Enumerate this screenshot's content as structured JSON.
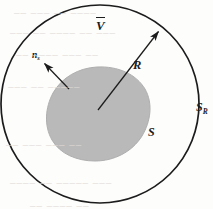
{
  "figure": {
    "caption_labels": {
      "outer_volume": "V",
      "outer_volume_has_overbar": true,
      "normal_vector": "n",
      "normal_vector_subscript": "s",
      "radius": "R",
      "inner_surface": "S",
      "outer_surface": "S",
      "outer_surface_subscript": "R"
    },
    "colors": {
      "stroke": "#1c1c1c",
      "blob_fill": "#b9b9b9",
      "blob_stroke": "#a8a8a8",
      "background": "#fdfdfc",
      "bleed_text": "#ded9d6"
    },
    "geometry": {
      "circle_center_x": 100,
      "circle_center_y": 104,
      "circle_radius": 99,
      "radius_arrow_start_x": 98,
      "radius_arrow_start_y": 110,
      "radius_arrow_end_x": 160,
      "radius_arrow_end_y": 30,
      "normal_arrow_start_x": 68,
      "normal_arrow_start_y": 88,
      "normal_arrow_end_x": 43,
      "normal_arrow_end_y": 62
    },
    "bleed_through": [
      {
        "text": "–– ––– –– ––––",
        "x": 14,
        "y": 6
      },
      {
        "text": "––– –– –––– –– –––",
        "x": 10,
        "y": 26
      },
      {
        "text": "–– –––– ––– ––",
        "x": 16,
        "y": 48
      },
      {
        "text": "––– –– –––––",
        "x": 8,
        "y": 80
      },
      {
        "text": "–– ––– ––– ––",
        "x": 6,
        "y": 138
      },
      {
        "text": "–––– –– ––––– –––",
        "x": 10,
        "y": 176
      },
      {
        "text": "–– –––– ––",
        "x": 30,
        "y": 199
      }
    ]
  }
}
